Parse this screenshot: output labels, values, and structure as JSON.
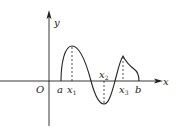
{
  "diagram": {
    "type": "function-graph",
    "axes": {
      "x_label": "x",
      "y_label": "y",
      "origin_label": "O"
    },
    "points": {
      "a": "a",
      "x1": "x",
      "x1_sub": "1",
      "x2": "x",
      "x2_sub": "2",
      "x3": "x",
      "x3_sub": "3",
      "b": "b"
    },
    "colors": {
      "stroke": "#222222",
      "background": "#ffffff"
    }
  }
}
